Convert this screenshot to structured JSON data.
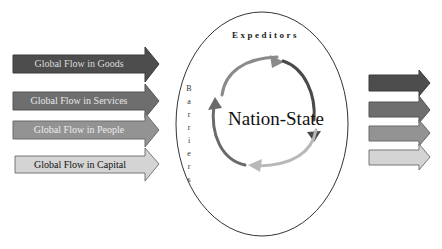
{
  "diagram": {
    "center_label": "Nation-State",
    "top_label": "Expeditors",
    "side_label": "Barriers",
    "side_letters": [
      "B",
      "a",
      "r",
      "r",
      "i",
      "e",
      "r",
      "s"
    ],
    "inflows": [
      {
        "label": "Global Flow in Goods",
        "fill": "#4d4d4d",
        "text_color": "#dcdcdc"
      },
      {
        "label": "Global Flow in Services",
        "fill": "#6e6e6e",
        "text_color": "#e6e6e6"
      },
      {
        "label": "Global Flow in People",
        "fill": "#939393",
        "text_color": "#ededed"
      },
      {
        "label": "Global Flow in Capital",
        "fill": "#d4d4d4",
        "text_color": "#111111"
      }
    ],
    "outflows": [
      {
        "fill": "#4d4d4d"
      },
      {
        "fill": "#6e6e6e"
      },
      {
        "fill": "#939393"
      },
      {
        "fill": "#d4d4d4"
      }
    ]
  }
}
